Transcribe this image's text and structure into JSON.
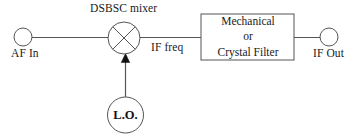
{
  "figure": {
    "kind": "block-diagram",
    "width": 354,
    "height": 137,
    "background_color": "#ffffff",
    "stroke_color": "#555555",
    "text_color": "#1a1a1a"
  },
  "labels": {
    "mixer_title": "DSBSC mixer",
    "af_in": "AF In",
    "if_freq": "IF freq",
    "if_out": "IF Out",
    "local_oscillator": "L.O."
  },
  "filter_block": {
    "line1": "Mechanical",
    "line2": "or",
    "line3": "Crystal Filter"
  },
  "nodes": [
    {
      "id": "af-in-terminal",
      "type": "terminal-circle",
      "label": "AF In",
      "cx": 23,
      "cy": 37,
      "r": 9
    },
    {
      "id": "dsbsc-mixer",
      "type": "mixer-circle",
      "label": "DSBSC mixer",
      "cx": 124,
      "cy": 38,
      "r": 16
    },
    {
      "id": "local-oscillator",
      "type": "oscillator-circle",
      "label": "L.O.",
      "cx": 125.5,
      "cy": 115,
      "r": 18
    },
    {
      "id": "filter-block",
      "type": "rectangle",
      "label": "Mechanical or Crystal Filter",
      "x": 201,
      "y": 14,
      "w": 93,
      "h": 46
    },
    {
      "id": "if-out-terminal",
      "type": "terminal-circle",
      "label": "IF Out",
      "cx": 329,
      "cy": 37,
      "r": 9
    }
  ],
  "edges": [
    {
      "id": "af-to-mixer",
      "from": "af-in-terminal",
      "to": "dsbsc-mixer",
      "arrow": false
    },
    {
      "id": "mixer-to-filter",
      "from": "dsbsc-mixer",
      "to": "filter-block",
      "label": "IF freq",
      "arrow": false
    },
    {
      "id": "filter-to-out",
      "from": "filter-block",
      "to": "if-out-terminal",
      "arrow": false
    },
    {
      "id": "lo-to-mixer",
      "from": "local-oscillator",
      "to": "dsbsc-mixer",
      "arrow": true
    }
  ]
}
